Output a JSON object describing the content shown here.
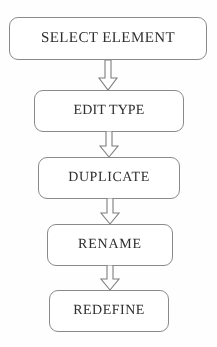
{
  "diagram": {
    "type": "vertical-flowchart",
    "orientation": "top-to-bottom",
    "style": {
      "background_color": "#fefefe",
      "node_fill": "#ffffff",
      "node_border_color": "#8a8a8a",
      "text_color": "#2f2f2f",
      "arrow_fill": "#ffffff",
      "arrow_border_color": "#7d7d7d",
      "node_shape": "rounded-rectangle",
      "connector_shape": "hollow-block-arrow"
    },
    "nodes": [
      {
        "id": "step-1",
        "label": "SELECT ELEMENT"
      },
      {
        "id": "step-2",
        "label": "EDIT TYPE"
      },
      {
        "id": "step-3",
        "label": "DUPLICATE"
      },
      {
        "id": "step-4",
        "label": "RENAME"
      },
      {
        "id": "step-5",
        "label": "REDEFINE"
      }
    ],
    "connectors": [
      {
        "id": "arrow-1",
        "from": "step-1",
        "to": "step-2",
        "direction": "down"
      },
      {
        "id": "arrow-2",
        "from": "step-2",
        "to": "step-3",
        "direction": "down"
      },
      {
        "id": "arrow-3",
        "from": "step-3",
        "to": "step-4",
        "direction": "down"
      },
      {
        "id": "arrow-4",
        "from": "step-4",
        "to": "step-5",
        "direction": "down"
      }
    ]
  }
}
